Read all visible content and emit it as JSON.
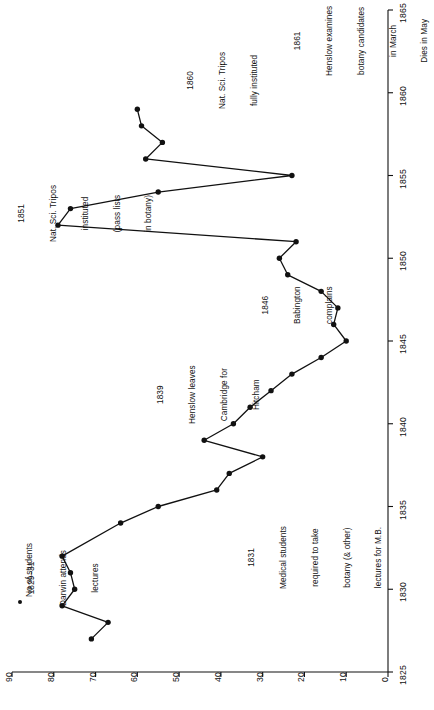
{
  "chart_data": {
    "type": "line",
    "title": "",
    "subtitle": "",
    "xlabel": "",
    "ylabel": "",
    "xlim": [
      1825,
      1865
    ],
    "ylim": [
      0,
      90
    ],
    "xticks": [
      1825,
      1830,
      1835,
      1840,
      1845,
      1850,
      1855,
      1860,
      1865
    ],
    "xticklabels": [
      "1825",
      "1830",
      "1835",
      "1840",
      "1845",
      "1850",
      "1855",
      "1860",
      "1865"
    ],
    "yticks": [
      0,
      10,
      20,
      30,
      40,
      50,
      60,
      70,
      80,
      90
    ],
    "yticklabels": [
      "0",
      "10",
      "20",
      "30",
      "40",
      "50",
      "60",
      "70",
      "80",
      "90"
    ],
    "grid": false,
    "orientation": "rotated-90",
    "legend": {
      "position": "top-left",
      "entries": [
        {
          "label": "No of students",
          "marker": "filled-circle",
          "color": "#111111"
        }
      ]
    },
    "series": [
      {
        "name": "No of students",
        "color": "#111111",
        "marker": "filled-circle",
        "x": [
          1827,
          1828,
          1829,
          1830,
          1831,
          1832,
          1834,
          1835,
          1836,
          1837,
          1838,
          1839,
          1840,
          1841,
          1842,
          1843,
          1844,
          1845,
          1846,
          1847,
          1848,
          1849,
          1850,
          1851,
          1852,
          1853,
          1854,
          1855,
          1856,
          1857,
          1858,
          1859
        ],
        "y": [
          71,
          67,
          78,
          75,
          76,
          78,
          64,
          55,
          41,
          38,
          30,
          44,
          37,
          33,
          28,
          23,
          16,
          10,
          13,
          12,
          16,
          24,
          26,
          22,
          79,
          76,
          55,
          23,
          58,
          54,
          59,
          60
        ],
        "values_label": "No of students"
      }
    ],
    "annotations": [
      {
        "id": "ann-1829-31",
        "lines": [
          "1829–31",
          "Darwin attends",
          "lectures"
        ],
        "x": 1829,
        "y": 88
      },
      {
        "id": "ann-1831",
        "lines": [
          "1831",
          "Medical students",
          "required to take",
          "botany (& other)",
          "lectures for M.B."
        ],
        "x": 1830,
        "y": 33
      },
      {
        "id": "ann-1839",
        "lines": [
          "1839",
          "Henslow leaves",
          "Cambridge for",
          "Hitcham"
        ],
        "x": 1840,
        "y": 56
      },
      {
        "id": "ann-1846",
        "lines": [
          "1846",
          "Babington",
          "complains"
        ],
        "x": 1846,
        "y": 32
      },
      {
        "id": "ann-1851",
        "lines": [
          "1851",
          "Nat. Sci. Tripos",
          "instituted",
          "(pass lists",
          "in botany)"
        ],
        "x": 1851,
        "y": 88
      },
      {
        "id": "ann-1860",
        "lines": [
          "1860",
          "Nat. Sci. Tripos",
          "fully instituted"
        ],
        "x": 1859,
        "y": 50
      },
      {
        "id": "ann-1861",
        "lines": [
          "1861",
          "Henslow examines",
          "botany candidates",
          "in March",
          "Dies in May"
        ],
        "x": 1861,
        "y": 22
      }
    ]
  },
  "legend": {
    "label": "No of students"
  },
  "axes": {
    "x": {
      "ticks": [
        "1825",
        "1830",
        "1835",
        "1840",
        "1845",
        "1850",
        "1855",
        "1860",
        "1865"
      ]
    },
    "y": {
      "ticks": [
        "0",
        "10",
        "20",
        "30",
        "40",
        "50",
        "60",
        "70",
        "80",
        "90"
      ]
    }
  },
  "annotations": {
    "a0": {
      "l0": "1829–31",
      "l1": "Darwin attends",
      "l2": "lectures"
    },
    "a1": {
      "l0": "1831",
      "l1": "Medical students",
      "l2": "required to take",
      "l3": "botany (& other)",
      "l4": "lectures for M.B."
    },
    "a2": {
      "l0": "1839",
      "l1": "Henslow leaves",
      "l2": "Cambridge for",
      "l3": "Hitcham"
    },
    "a3": {
      "l0": "1846",
      "l1": "Babington",
      "l2": "complains"
    },
    "a4": {
      "l0": "1851",
      "l1": "Nat. Sci. Tripos",
      "l2": "instituted",
      "l3": "(pass lists",
      "l4": "in botany)"
    },
    "a5": {
      "l0": "1860",
      "l1": "Nat. Sci. Tripos",
      "l2": "fully instituted"
    },
    "a6": {
      "l0": "1861",
      "l1": "Henslow examines",
      "l2": "botany candidates",
      "l3": "in March",
      "l4": "Dies in May"
    }
  }
}
